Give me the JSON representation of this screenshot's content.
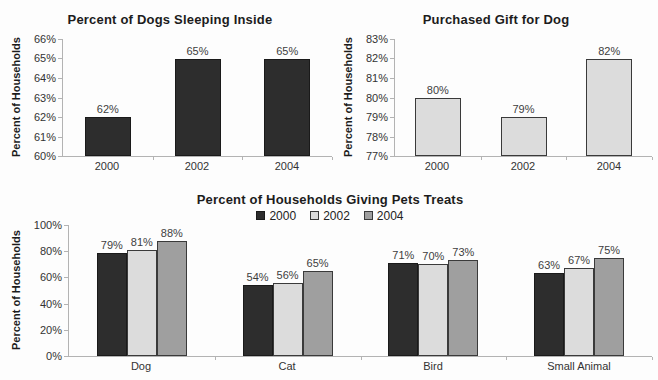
{
  "page": {
    "background": "#fdfdfd"
  },
  "chart_data": [
    {
      "id": "percent-dogs-sleeping-inside",
      "type": "bar",
      "title": "Percent of Dogs Sleeping Inside",
      "xlabel": "",
      "ylabel": "Percent of Households",
      "categories": [
        "2000",
        "2002",
        "2004"
      ],
      "series": [
        {
          "name": "",
          "color": "#2d2d2d",
          "border_color": "#1a1a1a",
          "values": [
            62,
            65,
            65
          ]
        }
      ],
      "data_labels": [
        "62%",
        "65%",
        "65%"
      ],
      "ylim": [
        60,
        66
      ],
      "ytick_step": 1,
      "ytick_suffix": "%",
      "grid": false,
      "legend": null
    },
    {
      "id": "purchased-gift-for-dog",
      "type": "bar",
      "title": "Purchased Gift for Dog",
      "xlabel": "",
      "ylabel": "Percent of Households",
      "categories": [
        "2000",
        "2002",
        "2004"
      ],
      "series": [
        {
          "name": "",
          "color": "#dcdcdc",
          "border_color": "#3a3a3a",
          "values": [
            80,
            79,
            82
          ]
        }
      ],
      "data_labels": [
        "80%",
        "79%",
        "82%"
      ],
      "ylim": [
        77,
        83
      ],
      "ytick_step": 1,
      "ytick_suffix": "%",
      "grid": false,
      "legend": null
    },
    {
      "id": "percent-households-giving-pets-treats",
      "type": "bar",
      "title": "Percent of Households Giving Pets Treats",
      "xlabel": "",
      "ylabel": "Percent of Households",
      "categories": [
        "Dog",
        "Cat",
        "Bird",
        "Small Animal"
      ],
      "series": [
        {
          "name": "2000",
          "color": "#2d2d2d",
          "border_color": "#1a1a1a",
          "values": [
            79,
            54,
            71,
            63
          ]
        },
        {
          "name": "2002",
          "color": "#dcdcdc",
          "border_color": "#3a3a3a",
          "values": [
            81,
            56,
            70,
            67
          ]
        },
        {
          "name": "2004",
          "color": "#9f9f9f",
          "border_color": "#3a3a3a",
          "values": [
            88,
            65,
            73,
            75
          ]
        }
      ],
      "data_labels": {
        "Dog": [
          "79%",
          "81%",
          "88%"
        ],
        "Cat": [
          "54%",
          "56%",
          "65%"
        ],
        "Bird": [
          "71%",
          "70%",
          "73%"
        ],
        "Small Animal": [
          "63%",
          "67%",
          "75%"
        ]
      },
      "ylim": [
        0,
        100
      ],
      "ytick_step": 20,
      "ytick_suffix": "%",
      "grid": false,
      "legend": {
        "position": "top-center",
        "entries": [
          "2000",
          "2002",
          "2004"
        ]
      }
    }
  ]
}
